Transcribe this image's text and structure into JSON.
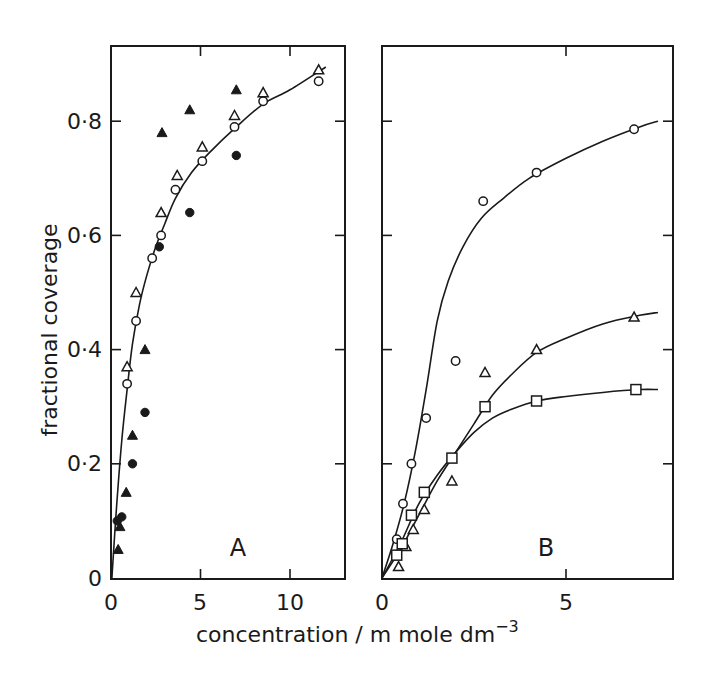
{
  "chart_data": [
    {
      "panel": "A",
      "type": "scatter",
      "title": "",
      "xlabel": "concentration / m mole dm^-3",
      "ylabel": "fractional coverage",
      "xlim": [
        0,
        13.1
      ],
      "ylim": [
        0,
        0.93
      ],
      "xticks": [
        0,
        5,
        10
      ],
      "yticks": [
        0,
        0.2,
        0.4,
        0.6,
        0.8
      ],
      "ytick_labels": [
        "0",
        "0·2",
        "0·4",
        "0·6",
        "0·8"
      ],
      "grid": false,
      "legend": null,
      "series": [
        {
          "name": "open circles",
          "marker": "circle-open",
          "x": [
            0.9,
            1.4,
            2.3,
            2.8,
            3.6,
            5.1,
            6.9,
            8.5,
            11.6
          ],
          "y": [
            0.34,
            0.45,
            0.56,
            0.6,
            0.68,
            0.73,
            0.79,
            0.835,
            0.87
          ]
        },
        {
          "name": "open triangles",
          "marker": "triangle-open",
          "x": [
            0.9,
            1.4,
            2.8,
            3.7,
            5.1,
            6.9,
            8.5,
            11.6
          ],
          "y": [
            0.37,
            0.5,
            0.64,
            0.705,
            0.755,
            0.81,
            0.85,
            0.89
          ]
        },
        {
          "name": "filled triangles",
          "marker": "triangle-filled",
          "x": [
            0.4,
            0.5,
            0.85,
            1.2,
            1.9,
            2.85,
            4.4,
            7.0
          ],
          "y": [
            0.05,
            0.09,
            0.15,
            0.25,
            0.4,
            0.78,
            0.82,
            0.855
          ]
        },
        {
          "name": "filled circles",
          "marker": "circle-filled",
          "x": [
            0.35,
            0.6,
            1.2,
            1.9,
            2.7,
            4.4,
            7.0
          ],
          "y": [
            0.1,
            0.107,
            0.2,
            0.29,
            0.58,
            0.64,
            0.74
          ]
        }
      ],
      "fit_curves": [
        {
          "name": "fit",
          "x": [
            0.05,
            0.3,
            0.6,
            0.9,
            1.2,
            1.6,
            2.0,
            2.5,
            3.0,
            3.6,
            4.5,
            5.5,
            7.0,
            8.5,
            10.0,
            12.0
          ],
          "y": [
            0.0,
            0.12,
            0.24,
            0.33,
            0.41,
            0.48,
            0.53,
            0.58,
            0.62,
            0.665,
            0.71,
            0.745,
            0.79,
            0.83,
            0.855,
            0.895
          ]
        }
      ],
      "annotations": [
        "A"
      ]
    },
    {
      "panel": "B",
      "type": "scatter",
      "title": "",
      "xlabel": "concentration / m mole dm^-3",
      "ylabel": "fractional coverage",
      "xlim": [
        0,
        7.9
      ],
      "ylim": [
        0,
        0.93
      ],
      "xticks": [
        0,
        5
      ],
      "yticks": [
        0,
        0.2,
        0.4,
        0.6,
        0.8
      ],
      "grid": false,
      "legend": null,
      "series": [
        {
          "name": "open circles",
          "marker": "circle-open",
          "x": [
            0.4,
            0.57,
            0.8,
            1.2,
            2.0,
            2.75,
            4.2,
            6.85
          ],
          "y": [
            0.068,
            0.13,
            0.2,
            0.28,
            0.38,
            0.66,
            0.71,
            0.786
          ]
        },
        {
          "name": "open triangles",
          "marker": "triangle-open",
          "x": [
            0.45,
            0.65,
            0.85,
            1.15,
            1.9,
            2.8,
            4.2,
            6.85
          ],
          "y": [
            0.02,
            0.055,
            0.085,
            0.12,
            0.17,
            0.36,
            0.4,
            0.457
          ]
        },
        {
          "name": "open squares",
          "marker": "square-open",
          "x": [
            0.4,
            0.55,
            0.8,
            1.15,
            1.9,
            2.8,
            4.2,
            6.9
          ],
          "y": [
            0.04,
            0.06,
            0.11,
            0.15,
            0.21,
            0.3,
            0.31,
            0.33
          ]
        }
      ],
      "fit_curves": [
        {
          "name": "circles fit",
          "x": [
            0,
            0.3,
            0.6,
            0.9,
            1.2,
            1.5,
            1.8,
            2.2,
            2.7,
            3.3,
            4.0,
            5.0,
            6.0,
            7.0,
            7.5
          ],
          "y": [
            0,
            0.06,
            0.13,
            0.22,
            0.33,
            0.45,
            0.52,
            0.58,
            0.63,
            0.665,
            0.7,
            0.735,
            0.765,
            0.79,
            0.8
          ]
        },
        {
          "name": "triangles fit",
          "x": [
            0,
            0.5,
            1.0,
            1.5,
            2.0,
            2.5,
            3.0,
            3.5,
            4.2,
            5.0,
            6.0,
            7.0,
            7.5
          ],
          "y": [
            0,
            0.05,
            0.11,
            0.17,
            0.22,
            0.27,
            0.32,
            0.355,
            0.395,
            0.42,
            0.445,
            0.46,
            0.465
          ]
        },
        {
          "name": "squares fit",
          "x": [
            0,
            0.5,
            1.0,
            1.5,
            2.0,
            2.5,
            3.0,
            3.5,
            4.2,
            5.0,
            6.0,
            7.0,
            7.5
          ],
          "y": [
            0,
            0.06,
            0.13,
            0.18,
            0.22,
            0.255,
            0.28,
            0.295,
            0.31,
            0.318,
            0.325,
            0.33,
            0.33
          ]
        }
      ],
      "annotations": [
        "B"
      ]
    }
  ],
  "labels": {
    "ylabel": "fractional coverage",
    "xlabel_main": "concentration / m mole dm",
    "xlabel_sup": "−3",
    "panel_a": "A",
    "panel_b": "B",
    "a_xticks": [
      "0",
      "5",
      "10"
    ],
    "b_xticks": [
      "0",
      "5"
    ],
    "yticks": [
      "0",
      "0·2",
      "0·4",
      "0·6",
      "0·8"
    ]
  }
}
